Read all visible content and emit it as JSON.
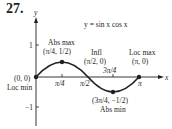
{
  "problem_number": "27.",
  "equation": "y = sin x cos x",
  "axes": {
    "x_label": "x",
    "y_label": "y",
    "y_ticks": [
      "1",
      "−1"
    ],
    "x_ticks": [
      "π/4",
      "π/2",
      "3π/4",
      "π"
    ]
  },
  "points": [
    {
      "name": "origin",
      "coord": "(0, 0)",
      "label": "Loc min"
    },
    {
      "name": "abs-max",
      "coord": "(π/4, 1/2)",
      "label": "Abs max"
    },
    {
      "name": "inflection",
      "coord": "(π/2, 0)",
      "label": "Infl"
    },
    {
      "name": "abs-min",
      "coord": "(3π/4, −1/2)",
      "label": "Abs min"
    },
    {
      "name": "loc-max",
      "coord": "(π, 0)",
      "label": "Loc max"
    }
  ],
  "colors": {
    "ink": "#231f20",
    "background": "#ffffff"
  }
}
